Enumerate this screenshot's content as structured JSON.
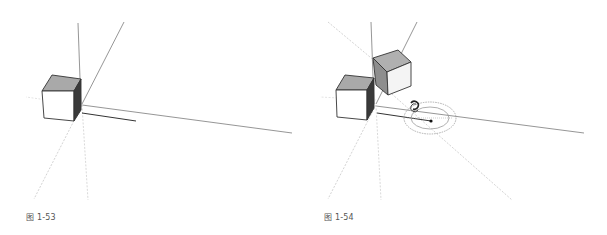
{
  "figures": [
    {
      "id": "fig-1-53",
      "caption": "图 1-53",
      "description": "Single cube at axis origin with a move/copy inference line along red axis"
    },
    {
      "id": "fig-1-54",
      "caption": "图 1-54",
      "description": "Second cube copied and rotated; rotate tool protractor shown on ground plane"
    }
  ],
  "colors": {
    "background": "#ffffff",
    "axis": "#8a8a8a",
    "axis_dotted": "#c8c8c8",
    "edge": "#333333",
    "face_top": "#a9a9a9",
    "face_front": "#ffffff",
    "face_side_dark": "#3a3a3a",
    "face_side_mid": "#8e8e8e",
    "protractor": "#9a9a9a",
    "caption": "#555555"
  }
}
